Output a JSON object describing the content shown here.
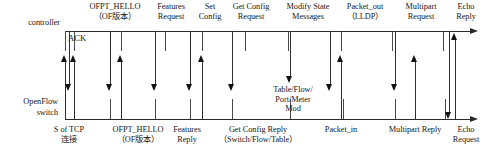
{
  "diagram": {
    "lanes": [
      {
        "id": "controller",
        "label": "controller"
      },
      {
        "id": "switch",
        "label": "OpenFlow\nswitch"
      }
    ],
    "inline_labels": [
      {
        "id": "ack",
        "text": "ACK"
      }
    ],
    "top_labels": [
      {
        "id": "ofpt-hello-top",
        "text": "OFPT_HELLO\n（OF版本）"
      },
      {
        "id": "features-request",
        "text": "Features\nRequest"
      },
      {
        "id": "set-config",
        "text": "Set\nConfig"
      },
      {
        "id": "get-config-request",
        "text": "Get Config\nRequest"
      },
      {
        "id": "modify-state-messages",
        "text": "Modify State\nMessages"
      },
      {
        "id": "packet-out",
        "text": "Packet_out\n（LLDP）"
      },
      {
        "id": "multipart-request",
        "text": "Multipart\nRequest"
      },
      {
        "id": "echo-reply",
        "text": "Echo\nReply"
      }
    ],
    "mid_labels": [
      {
        "id": "table-flow-port-meter-mod",
        "text": "Table/Flow/\nPort/Meter\nMod"
      }
    ],
    "bottom_labels": [
      {
        "id": "tcp-connection",
        "text": "S of TCP\n连接"
      },
      {
        "id": "ofpt-hello-bottom",
        "text": "OFPT_HELLO\n（OF版本）"
      },
      {
        "id": "features-reply",
        "text": "Features\nReply"
      },
      {
        "id": "get-config-reply",
        "text": "Get Config Reply\n（Switch/Flow/Table）"
      },
      {
        "id": "packet-in",
        "text": "Packet_in"
      },
      {
        "id": "multipart-reply",
        "text": "Multipart Reply"
      },
      {
        "id": "echo-request",
        "text": "Echo\nRequest"
      }
    ],
    "colors": {
      "line": "#2a2a2a",
      "arrow": "#2f2f2f",
      "text": "#171717",
      "background": "#ffffff"
    }
  }
}
